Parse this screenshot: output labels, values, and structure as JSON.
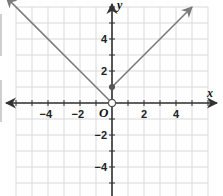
{
  "chart_data": {
    "type": "line",
    "title": "",
    "xlabel": "x",
    "ylabel": "y",
    "origin_label": "O",
    "xlim": [
      -6,
      6
    ],
    "ylim": [
      -6,
      6
    ],
    "grid": true,
    "x_tick_labels": [
      "-4",
      "-2",
      "2",
      "4"
    ],
    "x_tick_values": [
      -4,
      -2,
      2,
      4
    ],
    "y_tick_labels": [
      "4",
      "2",
      "-2",
      "-4"
    ],
    "y_tick_values": [
      4,
      2,
      -2,
      -4
    ],
    "series": [
      {
        "name": "left-ray",
        "equation": "y = -x, x < 0",
        "points": [
          [
            -6.6,
            6.6
          ],
          [
            0,
            0
          ]
        ],
        "start_arrow": true,
        "end_marker": "open-circle"
      },
      {
        "name": "right-ray",
        "equation": "y = x + 1, x >= 0",
        "points": [
          [
            0,
            1
          ],
          [
            5,
            6
          ]
        ],
        "start_marker": "closed-dot",
        "end_arrow": true
      }
    ],
    "colors": {
      "line": "#7a7a7a",
      "axis": "#333333",
      "grid": "#d9d9d9",
      "marker": "#555555"
    }
  }
}
